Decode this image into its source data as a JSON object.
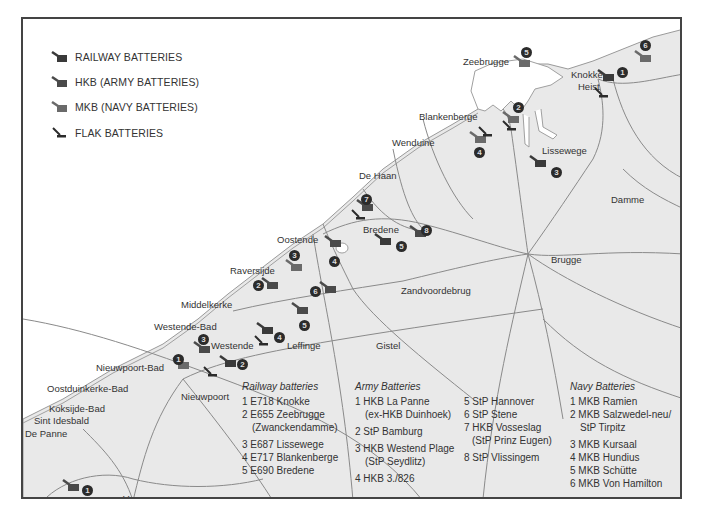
{
  "legend": {
    "items": [
      {
        "icon": "railway-battery-icon",
        "label": "RAILWAY BATTERIES",
        "color": "#3a3a3a"
      },
      {
        "icon": "army-battery-icon",
        "label": "HKB (ARMY BATTERIES)",
        "color": "#4a4a4a"
      },
      {
        "icon": "navy-battery-icon",
        "label": "MKB (NAVY BATTERIES)",
        "color": "#6a6a6a"
      },
      {
        "icon": "flak-battery-icon",
        "label": "FLAK BATTERIES",
        "color": "#2b2b2b"
      }
    ]
  },
  "places": [
    {
      "name": "Zeebrugge",
      "x": 440,
      "y": 37
    },
    {
      "name": "Knokke-",
      "x": 548,
      "y": 50
    },
    {
      "name": "Heist",
      "x": 555,
      "y": 62
    },
    {
      "name": "Blankenberge",
      "x": 396,
      "y": 92
    },
    {
      "name": "Wenduine",
      "x": 369,
      "y": 118
    },
    {
      "name": "Lissewege",
      "x": 519,
      "y": 126
    },
    {
      "name": "De Haan",
      "x": 336,
      "y": 151
    },
    {
      "name": "Damme",
      "x": 588,
      "y": 175
    },
    {
      "name": "Bredene",
      "x": 340,
      "y": 205
    },
    {
      "name": "Oostende",
      "x": 254,
      "y": 215
    },
    {
      "name": "Brugge",
      "x": 528,
      "y": 235
    },
    {
      "name": "Raversijde",
      "x": 207,
      "y": 246
    },
    {
      "name": "Zandvoordebrug",
      "x": 378,
      "y": 266
    },
    {
      "name": "Middelkerke",
      "x": 158,
      "y": 280
    },
    {
      "name": "Westende-Bad",
      "x": 131,
      "y": 302
    },
    {
      "name": "Westende",
      "x": 188,
      "y": 321
    },
    {
      "name": "Leffinge",
      "x": 264,
      "y": 321
    },
    {
      "name": "Gistel",
      "x": 353,
      "y": 321
    },
    {
      "name": "Nieuwpoort-Bad",
      "x": 73,
      "y": 343
    },
    {
      "name": "Oostduinkerke-Bad",
      "x": 24,
      "y": 364
    },
    {
      "name": "Nieuwpoort",
      "x": 158,
      "y": 372
    },
    {
      "name": "Koksijde-Bad",
      "x": 26,
      "y": 384
    },
    {
      "name": "Sint Idesbald",
      "x": 11,
      "y": 396
    },
    {
      "name": "De Panne",
      "x": 2,
      "y": 409
    },
    {
      "name": "Veurne",
      "x": 100,
      "y": 474
    }
  ],
  "markers": [
    {
      "type": "railway",
      "num": "1",
      "x": 578,
      "y": 56,
      "nx": 594,
      "ny": 48
    },
    {
      "type": "railway",
      "num": "2",
      "x": 200,
      "y": 342,
      "nx": 214,
      "ny": 340
    },
    {
      "type": "railway",
      "num": "3",
      "x": 510,
      "y": 142,
      "nx": 528,
      "ny": 148
    },
    {
      "type": "railway",
      "num": "4",
      "x": 237,
      "y": 309,
      "nx": 251,
      "ny": 313
    },
    {
      "type": "railway",
      "num": "5",
      "x": 355,
      "y": 220,
      "nx": 373,
      "ny": 222
    },
    {
      "type": "army",
      "num": "1",
      "x": 43,
      "y": 466,
      "nx": 59,
      "ny": 466
    },
    {
      "type": "army",
      "num": "2",
      "x": 242,
      "y": 264,
      "nx": 230,
      "ny": 261
    },
    {
      "type": "army",
      "num": "3",
      "x": 174,
      "y": 328,
      "nx": 175,
      "ny": 315
    },
    {
      "type": "army",
      "num": "4",
      "x": 305,
      "y": 222,
      "nx": 306,
      "ny": 237
    },
    {
      "type": "army",
      "num": "5",
      "x": 272,
      "y": 289,
      "nx": 276,
      "ny": 301
    },
    {
      "type": "army",
      "num": "6",
      "x": 300,
      "y": 268,
      "nx": 287,
      "ny": 267
    },
    {
      "type": "army",
      "num": "7",
      "x": 337,
      "y": 186,
      "nx": 338,
      "ny": 175
    },
    {
      "type": "army",
      "num": "8",
      "x": 390,
      "y": 212,
      "nx": 398,
      "ny": 206
    },
    {
      "type": "navy",
      "num": "1",
      "x": 153,
      "y": 344,
      "nx": 150,
      "ny": 335
    },
    {
      "type": "navy",
      "num": "2",
      "x": 483,
      "y": 98,
      "nx": 490,
      "ny": 83
    },
    {
      "type": "navy",
      "num": "3",
      "x": 266,
      "y": 246,
      "nx": 266,
      "ny": 231
    },
    {
      "type": "navy",
      "num": "4",
      "x": 450,
      "y": 118,
      "nx": 451,
      "ny": 128
    },
    {
      "type": "navy",
      "num": "5",
      "x": 494,
      "y": 42,
      "nx": 498,
      "ny": 28
    },
    {
      "type": "navy",
      "num": "6",
      "x": 615,
      "y": 37,
      "nx": 617,
      "ny": 21
    }
  ],
  "flak": [
    {
      "x": 575,
      "y": 74
    },
    {
      "x": 483,
      "y": 107
    },
    {
      "x": 459,
      "y": 113
    },
    {
      "x": 332,
      "y": 196
    },
    {
      "x": 235,
      "y": 322
    },
    {
      "x": 184,
      "y": 353
    }
  ],
  "key": {
    "railway": {
      "heading": "Railway batteries",
      "items": [
        "1 E718 Knokke",
        "2 E655 Zeebrugge",
        "   (Zwanckendamme)",
        "3 E687 Lissewege",
        "4 E717 Blankenberge",
        "5 E690 Bredene"
      ]
    },
    "army": {
      "heading": "Army Batteries",
      "items": [
        "1 HKB La Panne",
        "   (ex-HKB Duinhoek)",
        "2 StP Bamburg",
        "3 HKB Westend Plage",
        "   (StP Seydlitz)",
        "4 HKB 3./826"
      ]
    },
    "army2": {
      "items": [
        "5 StP Hannover",
        "6 StP Stene",
        "7 HKB Vosseslag",
        "   (StP Prinz Eugen)",
        "8 StP Vlissingem"
      ]
    },
    "navy": {
      "heading": "Navy Batteries",
      "items": [
        "1 MKB Ramien",
        "2 MKB Salzwedel-neu/",
        "   StP Tirpitz",
        "3 MKB Kursaal",
        "4 MKB Hundius",
        "5 MKB Schütte",
        "6 MKB Von Hamilton"
      ]
    }
  },
  "colors": {
    "land": "#e9e9e9",
    "sea": "#ffffff",
    "roads": "#8a8a8a",
    "border": "#444444"
  }
}
